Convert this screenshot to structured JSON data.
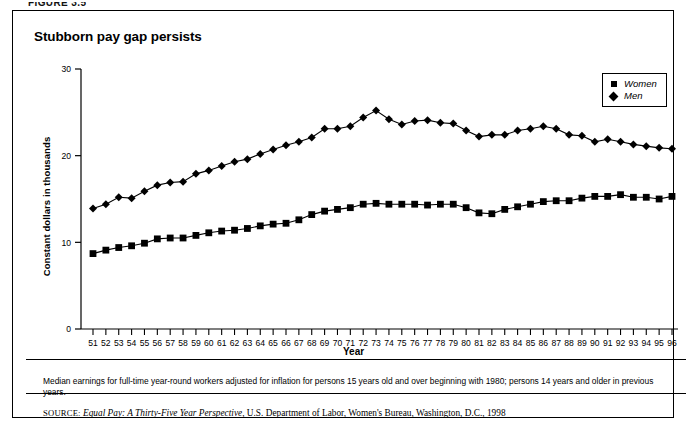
{
  "figure_kicker": "FIGURE 3.5",
  "frame": {
    "title": "Stubborn pay gap persists",
    "note": "Median earnings for full-time year-round workers adjusted for inflation for persons 15 years old and over beginning with 1980; persons 14 years and older in previous years.",
    "source": {
      "prefix": "SOURCE:",
      "italic_title": "Equal Pay: A Thirty-Five Year Perspective",
      "rest": ", U.S. Department of Labor, Women's Bureau, Washington, D.C., 1998"
    }
  },
  "legend": {
    "items": [
      {
        "label": "Women",
        "marker": "square-marker",
        "color": "#000000"
      },
      {
        "label": "Men",
        "marker": "diamond-marker",
        "color": "#000000"
      }
    ]
  },
  "chart_data": {
    "type": "line",
    "title": "Stubborn pay gap persists",
    "xlabel": "Year",
    "ylabel": "Constant dollars in thousands",
    "grid": false,
    "legend_position": "top-right",
    "ylim": [
      0,
      30
    ],
    "yticks": [
      0,
      10,
      20,
      30
    ],
    "ytick_labels": [
      "0",
      "10",
      "20",
      "30"
    ],
    "x": [
      "51",
      "52",
      "53",
      "54",
      "55",
      "56",
      "57",
      "58",
      "59",
      "60",
      "61",
      "62",
      "63",
      "64",
      "65",
      "66",
      "67",
      "68",
      "69",
      "70",
      "71",
      "72",
      "73",
      "74",
      "75",
      "76",
      "77",
      "78",
      "79",
      "80",
      "81",
      "82",
      "83",
      "84",
      "85",
      "86",
      "87",
      "88",
      "89",
      "90",
      "91",
      "92",
      "93",
      "94",
      "95",
      "96"
    ],
    "xlabel_values": [
      1951,
      1952,
      1953,
      1954,
      1955,
      1956,
      1957,
      1958,
      1959,
      1960,
      1961,
      1962,
      1963,
      1964,
      1965,
      1966,
      1967,
      1968,
      1969,
      1970,
      1971,
      1972,
      1973,
      1974,
      1975,
      1976,
      1977,
      1978,
      1979,
      1980,
      1981,
      1982,
      1983,
      1984,
      1985,
      1986,
      1987,
      1988,
      1989,
      1990,
      1991,
      1992,
      1993,
      1994,
      1995,
      1996
    ],
    "series": [
      {
        "name": "Men",
        "marker": "diamond-marker",
        "color": "#000000",
        "values": [
          13.9,
          14.4,
          15.2,
          15.1,
          15.9,
          16.6,
          16.9,
          17.0,
          17.9,
          18.3,
          18.8,
          19.3,
          19.6,
          20.2,
          20.7,
          21.2,
          21.6,
          22.1,
          23.1,
          23.1,
          23.4,
          24.4,
          25.2,
          24.2,
          23.6,
          24.0,
          24.1,
          23.8,
          23.7,
          22.9,
          22.2,
          22.4,
          22.4,
          22.9,
          23.1,
          23.4,
          23.1,
          22.4,
          22.3,
          21.6,
          21.9,
          21.6,
          21.3,
          21.1,
          20.9,
          20.8
        ]
      },
      {
        "name": "Women",
        "marker": "square-marker",
        "color": "#000000",
        "values": [
          8.7,
          9.1,
          9.4,
          9.6,
          9.9,
          10.4,
          10.5,
          10.5,
          10.8,
          11.1,
          11.3,
          11.4,
          11.6,
          11.9,
          12.1,
          12.2,
          12.6,
          13.2,
          13.6,
          13.8,
          14.0,
          14.4,
          14.5,
          14.4,
          14.4,
          14.4,
          14.3,
          14.4,
          14.4,
          14.0,
          13.4,
          13.3,
          13.8,
          14.1,
          14.4,
          14.7,
          14.8,
          14.8,
          15.1,
          15.3,
          15.3,
          15.5,
          15.2,
          15.2,
          15.0,
          15.3
        ]
      }
    ]
  }
}
